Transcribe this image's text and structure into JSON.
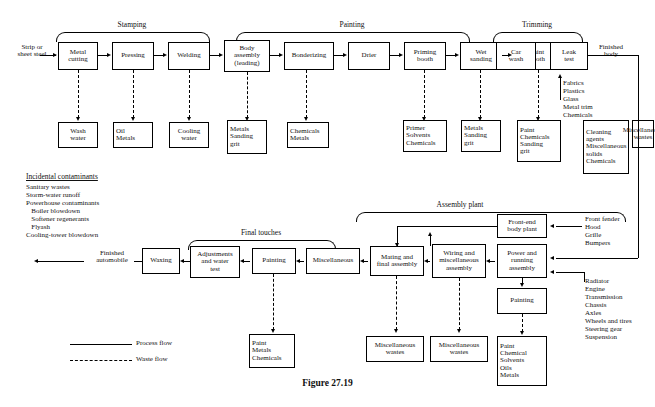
{
  "figure": {
    "caption": "Figure 27.19"
  },
  "legend": {
    "process": {
      "label": "Process flow",
      "style": "solid"
    },
    "waste": {
      "label": "Waste flow",
      "style": "dashed"
    }
  },
  "brackets": [
    {
      "name": "stamping",
      "label": "Stamping"
    },
    {
      "name": "painting",
      "label": "Painting"
    },
    {
      "name": "trimming",
      "label": "Trimming"
    },
    {
      "name": "final-touches",
      "label": "Final touches"
    },
    {
      "name": "assembly-plant",
      "label": "Assembly plant"
    }
  ],
  "inputs": {
    "raw_material": "Strip or\nsheet steel",
    "finished_body": "Finished\nbody",
    "finished_automobile": "Finished\nautomobile"
  },
  "top_process": [
    {
      "name": "metal-cutting",
      "lines": [
        "Metal",
        "cutting"
      ]
    },
    {
      "name": "pressing",
      "lines": [
        "Pressing"
      ]
    },
    {
      "name": "welding",
      "lines": [
        "Welding"
      ]
    },
    {
      "name": "body-assembly",
      "lines": [
        "Body",
        "assembly",
        "(leading)"
      ]
    },
    {
      "name": "bonderizing",
      "lines": [
        "Bonderizing"
      ]
    },
    {
      "name": "drier",
      "lines": [
        "Drier"
      ]
    },
    {
      "name": "priming-booth",
      "lines": [
        "Priming",
        "booth"
      ]
    },
    {
      "name": "wet-sanding",
      "lines": [
        "Wet",
        "sanding"
      ]
    },
    {
      "name": "paint-booth",
      "lines": [
        "Paint",
        "booth"
      ]
    },
    {
      "name": "car-wash",
      "lines": [
        "Car",
        "wash"
      ]
    },
    {
      "name": "leak-test",
      "lines": [
        "Leak",
        "test"
      ]
    }
  ],
  "top_wastes": [
    {
      "name": "waste-wash-water",
      "lines": [
        "Wash",
        "water"
      ]
    },
    {
      "name": "waste-oil-metals",
      "lines": [
        "Oil",
        "Metals"
      ]
    },
    {
      "name": "waste-cooling-water",
      "lines": [
        "Cooling",
        "water"
      ]
    },
    {
      "name": "waste-metals-sanding-grit",
      "lines": [
        "Metals",
        "Sanding",
        "grit"
      ]
    },
    {
      "name": "waste-chemicals-metals",
      "lines": [
        "Chemicals",
        "Metals"
      ]
    },
    {
      "name": "waste-primer-solvents-chemicals",
      "lines": [
        "Primer",
        "Solvents",
        "Chemicals"
      ]
    },
    {
      "name": "waste-metals-sanding-grit-2",
      "lines": [
        "Metals",
        "Sanding",
        "grit"
      ]
    },
    {
      "name": "waste-paint-chemicals-sanding-grit",
      "lines": [
        "Paint",
        "Chemicals",
        "Sanding",
        "grit"
      ]
    },
    {
      "name": "waste-cleaning-agents",
      "lines": [
        "Cleaning",
        "agents",
        "",
        "Miscellaneous",
        "solids",
        "",
        "Chemicals"
      ]
    },
    {
      "name": "waste-miscellaneous-wastes-top",
      "lines": [
        "Miscellaneous",
        "wastes"
      ]
    }
  ],
  "materials_paint_booth": "Fabrics\nPlastics\nGlass\nMetal trim\nChemicals",
  "incidental": {
    "heading": "Incidental contaminants",
    "items": "Sanitary wastes\nStorm-water runoff\nPowerhouse contaminants\n   Boiler blowdown\n   Softener regenerants\n   Flyash\nCooling-tower blowdown"
  },
  "bottom_process": [
    {
      "name": "waxing",
      "lines": [
        "Waxing"
      ]
    },
    {
      "name": "adjustments-water-test",
      "lines": [
        "Adjustments",
        "and water",
        "test"
      ]
    },
    {
      "name": "painting-final",
      "lines": [
        "Painting"
      ]
    },
    {
      "name": "miscellaneous",
      "lines": [
        "Miscellaneous"
      ]
    },
    {
      "name": "mating-final-assembly",
      "lines": [
        "Mating and",
        "final assembly"
      ]
    },
    {
      "name": "wiring-misc-assembly",
      "lines": [
        "Wiring and",
        "miscellaneous",
        "assembly"
      ]
    },
    {
      "name": "power-running-assembly",
      "lines": [
        "Power and",
        "running",
        "assembly"
      ]
    },
    {
      "name": "front-end-body-plant",
      "lines": [
        "Front-end",
        "body plant"
      ]
    },
    {
      "name": "painting-assembly",
      "lines": [
        "Painting"
      ]
    }
  ],
  "bottom_wastes": [
    {
      "name": "waste-paint-metals-chemicals",
      "lines": [
        "Paint",
        "Metals",
        "Chemicals"
      ]
    },
    {
      "name": "waste-miscellaneous-wastes-1",
      "lines": [
        "Miscellaneous",
        "wastes"
      ]
    },
    {
      "name": "waste-miscellaneous-wastes-2",
      "lines": [
        "Miscellaneous",
        "wastes"
      ]
    },
    {
      "name": "waste-paint-chemical-solvents-oils-metals",
      "lines": [
        "Paint",
        "Chemical",
        "Solvents",
        "Oils",
        "Metals"
      ]
    }
  ],
  "parts_front_end": "Front fender\nHood\nGrille\nBumpers",
  "parts_running": "Radiator\nEngine\nTransmission\nChassis\nAxles\nWheels and tires\nSteering gear\nSuspension"
}
